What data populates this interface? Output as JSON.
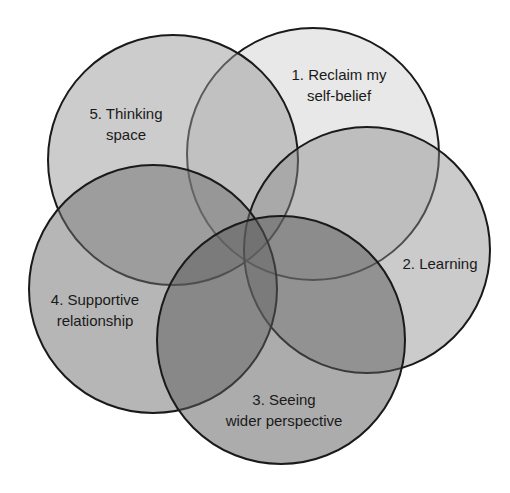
{
  "diagram": {
    "type": "overlapping-circles",
    "circles": [
      {
        "id": 1,
        "label_lines": [
          "1. Reclaim my",
          "self-belief"
        ],
        "cx": 313,
        "cy": 154,
        "r": 126,
        "fill": "#e8e8e8",
        "opacity": 1.0
      },
      {
        "id": 5,
        "label_lines": [
          "5. Thinking",
          "space"
        ],
        "cx": 173,
        "cy": 160,
        "r": 125,
        "fill": "#9a9a9a",
        "opacity": 0.5
      },
      {
        "id": 2,
        "label_lines": [
          "2. Learning"
        ],
        "cx": 367,
        "cy": 250,
        "r": 123,
        "fill": "#8c8c8c",
        "opacity": 0.45
      },
      {
        "id": 4,
        "label_lines": [
          "4. Supportive",
          "relationship"
        ],
        "cx": 153,
        "cy": 289,
        "r": 124,
        "fill": "#6e6e6e",
        "opacity": 0.5
      },
      {
        "id": 3,
        "label_lines": [
          "3. Seeing",
          "wider perspective"
        ],
        "cx": 281,
        "cy": 340,
        "r": 124,
        "fill": "#5a5a5a",
        "opacity": 0.5
      }
    ],
    "labels": {
      "c1": {
        "l1": "1. Reclaim my",
        "l2": "self-belief"
      },
      "c2": {
        "l1": "2. Learning"
      },
      "c3": {
        "l1": "3. Seeing",
        "l2": "wider perspective"
      },
      "c4": {
        "l1": "4. Supportive",
        "l2": "relationship"
      },
      "c5": {
        "l1": "5. Thinking",
        "l2": "space"
      }
    },
    "stroke": "#1a1a1a"
  }
}
